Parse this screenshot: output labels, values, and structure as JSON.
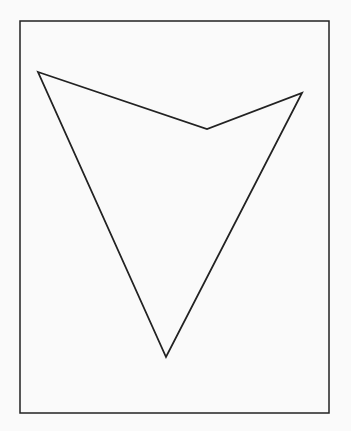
{
  "diagram": {
    "background": "#fafafa",
    "stroke": "#222222",
    "frame": {
      "x": 20,
      "y": 21,
      "width": 309,
      "height": 392,
      "stroke_width": 1.5
    },
    "polygon": {
      "shape": "concave-quadrilateral-arrowhead",
      "stroke_width": 1.8,
      "fill": "none",
      "vertices": [
        {
          "name": "left-tip",
          "x": 38,
          "y": 72
        },
        {
          "name": "notch",
          "x": 207,
          "y": 129
        },
        {
          "name": "right-tip",
          "x": 302,
          "y": 93
        },
        {
          "name": "bottom-tip",
          "x": 166,
          "y": 357
        }
      ]
    }
  }
}
